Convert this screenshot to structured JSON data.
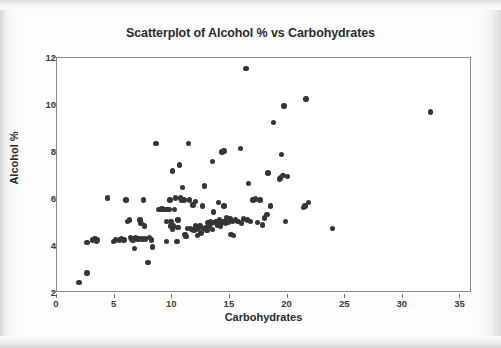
{
  "chart_data": {
    "type": "scatter",
    "title": "Scatterplot of Alcohol % vs Carbohydrates",
    "xlabel": "Carbohydrates",
    "ylabel": "Alcohol %",
    "xlim": [
      0,
      36
    ],
    "ylim": [
      2,
      12
    ],
    "xticks": [
      0,
      5,
      10,
      15,
      20,
      25,
      30,
      35
    ],
    "yticks": [
      2,
      4,
      6,
      8,
      10,
      12
    ],
    "grid": false,
    "legend": "none",
    "marker_color": "#353535",
    "plot_background": "#ffffff",
    "frame_color": "#8a8a8a",
    "points": [
      [
        1.9,
        2.45
      ],
      [
        2.6,
        2.85
      ],
      [
        2.6,
        4.15
      ],
      [
        3.1,
        4.25
      ],
      [
        3.3,
        4.3
      ],
      [
        3.5,
        4.25
      ],
      [
        3.4,
        4.2
      ],
      [
        4.4,
        6.05
      ],
      [
        4.9,
        4.2
      ],
      [
        5.1,
        4.25
      ],
      [
        5.4,
        4.25
      ],
      [
        5.6,
        4.3
      ],
      [
        5.8,
        4.25
      ],
      [
        6.0,
        5.95
      ],
      [
        6.1,
        5.05
      ],
      [
        6.3,
        5.1
      ],
      [
        6.4,
        4.35
      ],
      [
        6.5,
        4.3
      ],
      [
        6.6,
        4.25
      ],
      [
        6.7,
        3.9
      ],
      [
        6.8,
        4.35
      ],
      [
        7.0,
        4.3
      ],
      [
        7.1,
        4.3
      ],
      [
        7.2,
        5.1
      ],
      [
        7.3,
        4.95
      ],
      [
        7.4,
        4.3
      ],
      [
        7.5,
        5.95
      ],
      [
        7.6,
        4.85
      ],
      [
        7.7,
        4.3
      ],
      [
        7.9,
        3.3
      ],
      [
        8.0,
        4.35
      ],
      [
        8.2,
        4.25
      ],
      [
        8.3,
        3.95
      ],
      [
        8.6,
        8.35
      ],
      [
        8.8,
        5.55
      ],
      [
        9.0,
        5.55
      ],
      [
        9.1,
        5.6
      ],
      [
        9.2,
        5.55
      ],
      [
        9.3,
        5.55
      ],
      [
        9.4,
        5.55
      ],
      [
        9.5,
        4.2
      ],
      [
        9.5,
        5.05
      ],
      [
        9.6,
        5.55
      ],
      [
        9.7,
        5.55
      ],
      [
        9.8,
        5.95
      ],
      [
        9.9,
        4.85
      ],
      [
        9.9,
        5.05
      ],
      [
        10.0,
        4.7
      ],
      [
        10.0,
        7.2
      ],
      [
        10.1,
        4.85
      ],
      [
        10.2,
        5.55
      ],
      [
        10.3,
        6.05
      ],
      [
        10.4,
        4.2
      ],
      [
        10.5,
        4.8
      ],
      [
        10.5,
        5.1
      ],
      [
        10.6,
        7.45
      ],
      [
        10.7,
        6.05
      ],
      [
        10.8,
        5.95
      ],
      [
        10.9,
        6.5
      ],
      [
        11.0,
        5.95
      ],
      [
        11.1,
        4.5
      ],
      [
        11.2,
        4.4
      ],
      [
        11.3,
        4.75
      ],
      [
        11.4,
        8.35
      ],
      [
        11.5,
        5.95
      ],
      [
        11.6,
        4.75
      ],
      [
        11.7,
        4.7
      ],
      [
        11.8,
        5.75
      ],
      [
        11.9,
        4.65
      ],
      [
        12.0,
        4.85
      ],
      [
        12.0,
        5.9
      ],
      [
        12.1,
        4.7
      ],
      [
        12.2,
        4.45
      ],
      [
        12.3,
        4.75
      ],
      [
        12.4,
        4.85
      ],
      [
        12.5,
        4.55
      ],
      [
        12.6,
        5.7
      ],
      [
        12.7,
        4.75
      ],
      [
        12.8,
        6.55
      ],
      [
        12.9,
        4.8
      ],
      [
        13.0,
        4.65
      ],
      [
        13.1,
        5.0
      ],
      [
        13.2,
        4.85
      ],
      [
        13.3,
        5.05
      ],
      [
        13.4,
        4.95
      ],
      [
        13.5,
        7.6
      ],
      [
        13.5,
        4.7
      ],
      [
        13.6,
        5.45
      ],
      [
        13.7,
        5.0
      ],
      [
        13.8,
        5.05
      ],
      [
        13.9,
        4.9
      ],
      [
        14.0,
        5.85
      ],
      [
        14.1,
        5.1
      ],
      [
        14.2,
        4.85
      ],
      [
        14.3,
        8.0
      ],
      [
        14.3,
        5.0
      ],
      [
        14.4,
        5.05
      ],
      [
        14.5,
        8.05
      ],
      [
        14.5,
        5.7
      ],
      [
        14.6,
        4.95
      ],
      [
        14.7,
        5.2
      ],
      [
        14.8,
        5.1
      ],
      [
        14.9,
        5.0
      ],
      [
        15.0,
        5.15
      ],
      [
        15.1,
        4.5
      ],
      [
        15.2,
        5.05
      ],
      [
        15.3,
        4.45
      ],
      [
        15.5,
        5.1
      ],
      [
        15.7,
        5.05
      ],
      [
        15.9,
        8.15
      ],
      [
        16.0,
        4.95
      ],
      [
        16.2,
        5.15
      ],
      [
        16.4,
        11.55
      ],
      [
        16.5,
        5.1
      ],
      [
        16.6,
        6.65
      ],
      [
        16.8,
        5.05
      ],
      [
        17.0,
        5.95
      ],
      [
        17.2,
        6.0
      ],
      [
        17.4,
        5.0
      ],
      [
        17.6,
        5.95
      ],
      [
        17.8,
        4.9
      ],
      [
        18.0,
        5.2
      ],
      [
        18.2,
        5.35
      ],
      [
        18.3,
        7.1
      ],
      [
        18.5,
        5.7
      ],
      [
        18.8,
        9.25
      ],
      [
        19.3,
        6.85
      ],
      [
        19.4,
        6.9
      ],
      [
        19.5,
        7.9
      ],
      [
        19.6,
        7.0
      ],
      [
        19.7,
        9.95
      ],
      [
        19.8,
        5.05
      ],
      [
        20.0,
        6.95
      ],
      [
        21.4,
        5.65
      ],
      [
        21.5,
        5.7
      ],
      [
        21.6,
        10.25
      ],
      [
        21.8,
        5.85
      ],
      [
        23.9,
        4.75
      ],
      [
        32.4,
        9.7
      ]
    ]
  }
}
